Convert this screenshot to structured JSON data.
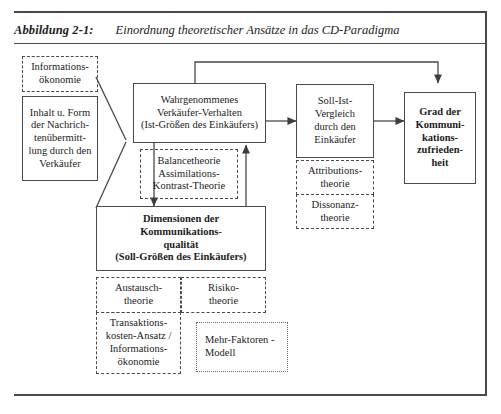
{
  "caption": {
    "figure_label": "Abbildung 2-1:",
    "title": "Einordnung theoretischer Ansätze in das CD-Paradigma"
  },
  "nodes": {
    "informationsoekonomie_top": {
      "lines": [
        "Informations-",
        "ökonomie"
      ],
      "style": "dashed"
    },
    "inhalt_form": {
      "lines": [
        "Inhalt u. Form",
        "der Nachrich-",
        "tenübermitt-",
        "lung durch den",
        "Verkäufer"
      ],
      "style": "solid"
    },
    "wahrgenommenes": {
      "lines": [
        "Wahrgenommenes",
        "Verkäufer-Verhalten",
        "(Ist-Größen des Einkäufers)"
      ],
      "style": "solid"
    },
    "balance": {
      "lines": [
        "Balancetheorie",
        "Assimilations-",
        "Kontrast-Theorie"
      ],
      "style": "dashed"
    },
    "soll_ist": {
      "lines": [
        "Soll-Ist-",
        "Vergleich",
        "durch den",
        "Einkäufer"
      ],
      "style": "solid"
    },
    "grad": {
      "lines": [
        "Grad der",
        "Kommuni-",
        "kations-",
        "zufrieden-",
        "heit"
      ],
      "style": "solid"
    },
    "attributions": {
      "lines": [
        "Attributions-",
        "theorie"
      ],
      "style": "dashed"
    },
    "dissonanz": {
      "lines": [
        "Dissonanz-",
        "theorie"
      ],
      "style": "dashed"
    },
    "dimensionen": {
      "lines": [
        "Dimensionen der",
        "Kommunikations-",
        "qualität",
        "(Soll-Größen des Einkäufers)"
      ],
      "style": "solid"
    },
    "austausch": {
      "lines": [
        "Austausch-",
        "theorie"
      ],
      "style": "dashed"
    },
    "risiko": {
      "lines": [
        "Risiko-",
        "theorie"
      ],
      "style": "dashed"
    },
    "transaktionskosten": {
      "lines": [
        "Transaktions-",
        "kosten-Ansatz /",
        "Informations-",
        "ökonomie"
      ],
      "style": "dashed"
    },
    "mehr_faktoren": {
      "lines": [
        "Mehr-Faktoren -",
        "Modell"
      ],
      "style": "dotted"
    }
  },
  "colors": {
    "line": "#4a4a4a",
    "text": "#1c1c1c",
    "background": "#ffffff"
  },
  "connectors": [
    {
      "name": "wahrgenommenes-to-soll-ist",
      "arrow": true
    },
    {
      "name": "soll-ist-to-grad",
      "arrow": true
    },
    {
      "name": "wahrgenommenes-to-grad-bypass",
      "arrow": true
    },
    {
      "name": "inhalt-to-wahrgenommenes",
      "arrow": false
    },
    {
      "name": "inhalt-to-dimensionen",
      "arrow": false
    },
    {
      "name": "wahrgenommenes-to-dimensionen",
      "arrow": true
    },
    {
      "name": "dimensionen-to-wahrgenommenes",
      "arrow": true
    }
  ]
}
